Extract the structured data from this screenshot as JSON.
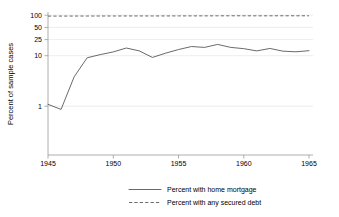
{
  "chart_data": {
    "type": "line",
    "title": "",
    "xlabel": "",
    "ylabel": "Percent of sample cases",
    "yscale": "log",
    "ylim": [
      0.7,
      115
    ],
    "xlim": [
      1944.3,
      1965.7
    ],
    "yticks": [
      1,
      10,
      25,
      50,
      100
    ],
    "ytick_labels": [
      "1",
      "10",
      "25",
      "50",
      "100"
    ],
    "xticks": [
      1945,
      1950,
      1955,
      1960,
      1965
    ],
    "xtick_labels": [
      "1945",
      "1950",
      "1955",
      "1960",
      "1965"
    ],
    "grid": true,
    "grid_axis": "y",
    "legend_position": "bottom",
    "x": [
      1945,
      1946,
      1947,
      1948,
      1949,
      1950,
      1951,
      1952,
      1953,
      1954,
      1955,
      1956,
      1957,
      1958,
      1959,
      1960,
      1961,
      1962,
      1963,
      1964,
      1965
    ],
    "series": [
      {
        "name": "Percent with home mortgage",
        "style": "solid",
        "color": "#59595c",
        "values": [
          1.1,
          0.85,
          4.4,
          11.6,
          13.6,
          15.6,
          19.0,
          16.4,
          11.8,
          14.6,
          17.6,
          20.5,
          19.6,
          22.8,
          19.6,
          18.4,
          16.4,
          18.6,
          16.2,
          15.7,
          16.6
        ]
      },
      {
        "name": "Percent with any secured debt",
        "style": "dashed",
        "color": "#59595c",
        "values": [
          95.5,
          95.6,
          95.8,
          95.9,
          96.0,
          96.1,
          96.2,
          96.3,
          96.2,
          96.3,
          96.4,
          96.5,
          96.6,
          96.8,
          97.0,
          97.0,
          96.8,
          96.9,
          97.1,
          97.0,
          97.0
        ]
      }
    ]
  },
  "legend": {
    "items": [
      {
        "label": "Percent with home mortgage",
        "style": "solid"
      },
      {
        "label": "Percent with any secured debt",
        "style": "dashed"
      }
    ]
  },
  "axes": {
    "y_title": "Percent of sample cases"
  }
}
